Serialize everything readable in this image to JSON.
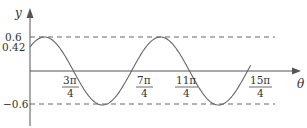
{
  "chart_data": {
    "type": "line",
    "title": "",
    "function": "y = 0.6 cos(θ − π/4)",
    "xlabel": "θ",
    "ylabel": "y",
    "x_ticks": [
      {
        "num": "3π",
        "den": "4",
        "value": 2.356
      },
      {
        "num": "7π",
        "den": "4",
        "value": 5.498
      },
      {
        "num": "11π",
        "den": "4",
        "value": 8.639
      },
      {
        "num": "15π",
        "den": "4",
        "value": 11.781
      }
    ],
    "y_ticks": [
      "0.6",
      "0.42",
      "−0.6"
    ],
    "y_values": {
      "max": 0.6,
      "intercept": 0.42,
      "min": -0.6
    },
    "reference_lines": [
      {
        "y": 0.6,
        "style": "dashed"
      },
      {
        "y": -0.6,
        "style": "dashed"
      }
    ],
    "xlim": [
      0,
      11.9
    ],
    "ylim": [
      -0.9,
      0.8
    ],
    "grid": false,
    "legend": null
  },
  "axes": {
    "y_label": "y",
    "x_label": "θ",
    "y_tick_top": "0.6",
    "y_tick_intercept": "0.42",
    "y_tick_bottom": "−0.6",
    "x_ticks": [
      {
        "num": "3π",
        "den": "4"
      },
      {
        "num": "7π",
        "den": "4"
      },
      {
        "num": "11π",
        "den": "4"
      },
      {
        "num": "15π",
        "den": "4"
      }
    ]
  }
}
